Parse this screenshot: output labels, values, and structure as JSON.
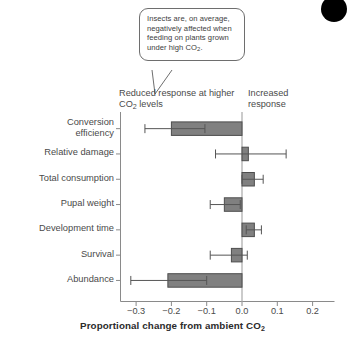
{
  "callout": {
    "text": "Insects are, on average, negatively affected when feeding on plants grown under high CO2."
  },
  "annotations": {
    "left": "Reduced response at higher CO2 levels",
    "right": "Increased response"
  },
  "chart_data": {
    "type": "bar",
    "orientation": "horizontal",
    "title": "",
    "xlabel": "Proportional change from ambient CO2",
    "ylabel": "",
    "xlim": [
      -0.35,
      0.23
    ],
    "xticks": [
      -0.3,
      -0.2,
      -0.1,
      0.0,
      0.1,
      0.2
    ],
    "xticklabels": [
      "-0.3",
      "-0.2",
      "-0.1",
      "0.0",
      "0.1",
      "0.2"
    ],
    "grid": false,
    "legend": null,
    "zero_line": 0.0,
    "bar_color": "#808080",
    "bar_edge_color": "#4d4d4d",
    "categories": [
      "Conversion efficiency",
      "Relative damage",
      "Total consumption",
      "Pupal weight",
      "Development time",
      "Survival",
      "Abundance"
    ],
    "values": [
      -0.2,
      0.018,
      0.035,
      -0.05,
      0.035,
      -0.03,
      -0.21
    ],
    "error_low": [
      -0.275,
      -0.075,
      0.0,
      -0.09,
      0.012,
      -0.09,
      -0.315
    ],
    "error_high": [
      -0.105,
      0.125,
      0.06,
      -0.005,
      0.055,
      0.015,
      -0.1
    ]
  }
}
